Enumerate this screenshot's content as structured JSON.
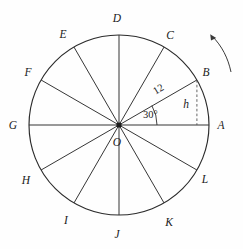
{
  "figure": {
    "type": "geometry-diagram",
    "center_label": "O",
    "radius_length_label": "12",
    "angle_label": "30°",
    "height_label": "h",
    "rotation_indicator": "counterclockwise-arrow"
  },
  "geometry": {
    "center": {
      "x": 119,
      "y": 125
    },
    "radius_px": 90,
    "num_spokes": 12,
    "spoke_step_degrees": 30,
    "start_angle_degrees": 0
  },
  "points": [
    {
      "label": "A",
      "angle_deg": 0,
      "label_x": 221,
      "label_y": 129
    },
    {
      "label": "B",
      "angle_deg": 30,
      "label_x": 206,
      "label_y": 76
    },
    {
      "label": "C",
      "angle_deg": 60,
      "label_x": 170,
      "label_y": 39
    },
    {
      "label": "D",
      "angle_deg": 90,
      "label_x": 117,
      "label_y": 22
    },
    {
      "label": "E",
      "angle_deg": 120,
      "label_x": 63,
      "label_y": 38
    },
    {
      "label": "F",
      "angle_deg": 150,
      "label_x": 28,
      "label_y": 76
    },
    {
      "label": "G",
      "angle_deg": 180,
      "label_x": 13,
      "label_y": 129
    },
    {
      "label": "H",
      "angle_deg": 210,
      "label_x": 26,
      "label_y": 184
    },
    {
      "label": "I",
      "angle_deg": 240,
      "label_x": 66,
      "label_y": 224
    },
    {
      "label": "J",
      "angle_deg": 270,
      "label_x": 117,
      "label_y": 238
    },
    {
      "label": "K",
      "angle_deg": 300,
      "label_x": 169,
      "label_y": 226
    },
    {
      "label": "L",
      "angle_deg": 330,
      "label_x": 205,
      "label_y": 183
    }
  ],
  "annotations": {
    "radius_text": "12",
    "radius_text_x": 160,
    "radius_text_y": 92,
    "radius_text_rotation": -30,
    "angle_text": "30°",
    "angle_text_x": 143,
    "angle_text_y": 118,
    "height_text": "h",
    "height_text_x": 186,
    "height_text_y": 108
  },
  "colors": {
    "stroke": "#2b2b2b",
    "dashed_stroke": "#555555",
    "text": "#1a1a1a",
    "background": "#fefefe",
    "arrow": "#3a3a3a"
  }
}
